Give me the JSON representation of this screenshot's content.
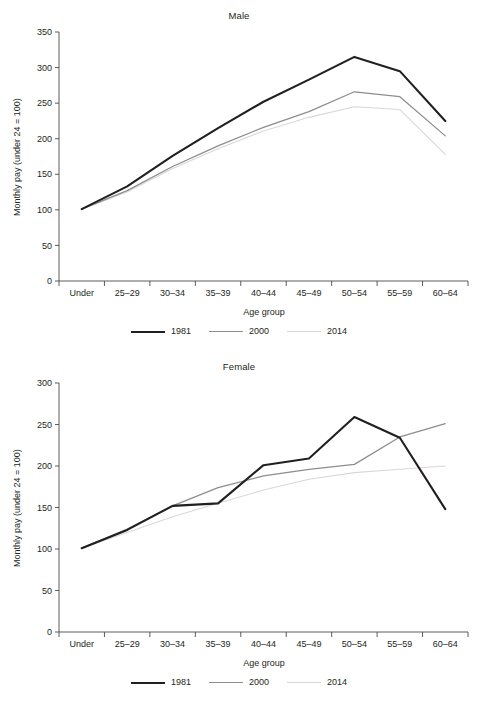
{
  "figure": {
    "ylabel": "Monthly pay (under 24 = 100)",
    "xlabel": "Age group",
    "legend": [
      {
        "label": "1981",
        "color": "#231f20"
      },
      {
        "label": "2000",
        "color": "#8d8d8d"
      },
      {
        "label": "2014",
        "color": "#d8d8d8"
      }
    ]
  },
  "chart_data": [
    {
      "type": "line",
      "title": "Male",
      "xlabel": "Age group",
      "ylabel": "Monthly pay (under 24 = 100)",
      "categories": [
        "Under 24",
        "25–29",
        "30–34",
        "35–39",
        "40–44",
        "45–49",
        "50–54",
        "55–59",
        "60–64"
      ],
      "ylim": [
        0,
        350
      ],
      "yticks": [
        0,
        50,
        100,
        150,
        200,
        250,
        300,
        350
      ],
      "grid": false,
      "legend_position": "bottom",
      "series": [
        {
          "name": "1981",
          "color": "#231f20",
          "values": [
            101,
            133,
            176,
            215,
            252,
            283,
            315,
            295,
            225
          ]
        },
        {
          "name": "2000",
          "color": "#8d8d8d",
          "values": [
            101,
            127,
            161,
            190,
            216,
            238,
            266,
            259,
            204
          ]
        },
        {
          "name": "2014",
          "color": "#d8d8d8",
          "values": [
            101,
            125,
            158,
            186,
            211,
            230,
            245,
            241,
            178
          ]
        }
      ]
    },
    {
      "type": "line",
      "title": "Female",
      "xlabel": "Age group",
      "ylabel": "Monthly pay (under 24 = 100)",
      "categories": [
        "Under 24",
        "25–29",
        "30–34",
        "35–39",
        "40–44",
        "45–49",
        "50–54",
        "55–59",
        "60–64"
      ],
      "ylim": [
        0,
        300
      ],
      "yticks": [
        0,
        50,
        100,
        150,
        200,
        250,
        300
      ],
      "grid": false,
      "legend_position": "bottom",
      "series": [
        {
          "name": "1981",
          "color": "#231f20",
          "values": [
            101,
            123,
            152,
            155,
            201,
            209,
            259,
            234,
            148
          ]
        },
        {
          "name": "2000",
          "color": "#8d8d8d",
          "values": [
            101,
            124,
            152,
            174,
            188,
            196,
            202,
            235,
            251
          ]
        },
        {
          "name": "2014",
          "color": "#d8d8d8",
          "values": [
            101,
            120,
            139,
            155,
            171,
            184,
            192,
            196,
            200
          ]
        }
      ]
    }
  ]
}
